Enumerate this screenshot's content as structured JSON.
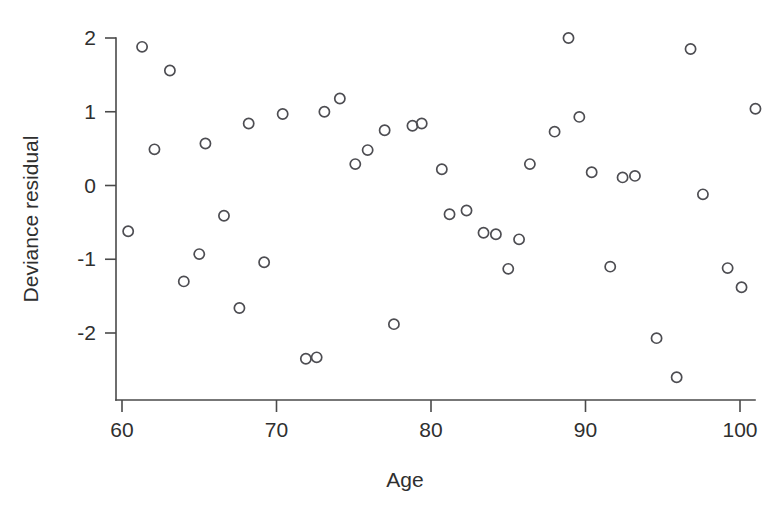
{
  "figure": {
    "width": 769,
    "height": 510,
    "background": "#ffffff",
    "ink_color": "#4a4a4a",
    "marker_color": "#4d4d52",
    "ghost_text": {
      "line1": "",
      "line2": "",
      "line3": ""
    }
  },
  "chart_data": {
    "type": "scatter",
    "title": "",
    "xlabel": "Age",
    "ylabel": "Deviance residual",
    "xlim": [
      58.5,
      104.5
    ],
    "ylim": [
      -2.9,
      2.25
    ],
    "xticks": [
      60,
      70,
      80,
      90,
      100
    ],
    "xticklabels": [
      "60",
      "70",
      "80",
      "90",
      "100"
    ],
    "yticks": [
      2,
      1,
      0,
      -1,
      -2
    ],
    "yticklabels": [
      "2",
      "1",
      "0",
      "-1",
      "-2"
    ],
    "grid": false,
    "legend": null,
    "marker": "open-circle",
    "series": [
      {
        "name": "Deviance residual",
        "x": [
          60.4,
          61.3,
          62.0,
          63.1,
          64.0,
          65.0,
          65.4,
          66.1,
          67.5,
          68.0,
          68.4,
          69.6,
          70.2,
          71.4,
          72.4,
          73.1,
          74.1,
          75.1,
          75.6,
          76.6,
          77.3,
          78.3,
          79.2,
          79.6,
          80.9,
          81.6,
          82.0,
          83.5,
          83.8,
          84.4,
          85.0,
          86.1,
          86.4,
          87.8,
          88.0,
          89.6,
          90.4,
          91.4,
          92.4,
          93.7,
          94.3,
          95.6,
          96.3,
          97.8,
          98.3,
          99.8,
          101.2,
          102.5,
          102.8,
          103.6
        ],
        "y": [
          -0.62,
          1.88,
          0.49,
          1.56,
          -1.3,
          -0.93,
          0.57,
          -0.41,
          -1.66,
          0.84,
          -1.04,
          0.97,
          -2.35,
          -2.33,
          1.0,
          1.18,
          0.29,
          0.48,
          0.75,
          -1.88,
          0.81,
          0.84,
          0.22,
          -0.39,
          -0.34,
          -0.64,
          -0.66,
          -1.13,
          -0.73,
          0.29,
          0.73,
          2.0,
          0.93,
          0.18,
          -1.1,
          0.11,
          0.13,
          -2.07,
          -2.6,
          1.85,
          -0.12,
          -1.12,
          -1.38,
          1.04,
          0.0,
          0.0,
          0.0,
          0.0,
          0.0,
          0.0
        ]
      }
    ],
    "points": [
      {
        "x": 60.4,
        "y": -0.62
      },
      {
        "x": 61.3,
        "y": 1.88
      },
      {
        "x": 62.1,
        "y": 0.49
      },
      {
        "x": 63.1,
        "y": 1.56
      },
      {
        "x": 64.0,
        "y": -1.3
      },
      {
        "x": 65.0,
        "y": -0.93
      },
      {
        "x": 65.4,
        "y": 0.57
      },
      {
        "x": 66.6,
        "y": -0.41
      },
      {
        "x": 67.6,
        "y": -1.66
      },
      {
        "x": 68.2,
        "y": 0.84
      },
      {
        "x": 69.2,
        "y": -1.04
      },
      {
        "x": 70.4,
        "y": 0.97
      },
      {
        "x": 71.9,
        "y": -2.35
      },
      {
        "x": 72.6,
        "y": -2.33
      },
      {
        "x": 73.1,
        "y": 1.0
      },
      {
        "x": 74.1,
        "y": 1.18
      },
      {
        "x": 75.1,
        "y": 0.29
      },
      {
        "x": 75.9,
        "y": 0.48
      },
      {
        "x": 77.0,
        "y": 0.75
      },
      {
        "x": 77.6,
        "y": -1.88
      },
      {
        "x": 78.8,
        "y": 0.81
      },
      {
        "x": 79.4,
        "y": 0.84
      },
      {
        "x": 80.7,
        "y": 0.22
      },
      {
        "x": 81.2,
        "y": -0.39
      },
      {
        "x": 82.3,
        "y": -0.34
      },
      {
        "x": 83.4,
        "y": -0.64
      },
      {
        "x": 84.2,
        "y": -0.66
      },
      {
        "x": 85.0,
        "y": -1.13
      },
      {
        "x": 85.7,
        "y": -0.73
      },
      {
        "x": 86.4,
        "y": 0.29
      },
      {
        "x": 88.0,
        "y": 0.73
      },
      {
        "x": 88.9,
        "y": 2.0
      },
      {
        "x": 89.6,
        "y": 0.93
      },
      {
        "x": 90.4,
        "y": 0.18
      },
      {
        "x": 91.6,
        "y": -1.1
      },
      {
        "x": 92.4,
        "y": 0.11
      },
      {
        "x": 93.2,
        "y": 0.13
      },
      {
        "x": 94.6,
        "y": -2.07
      },
      {
        "x": 95.9,
        "y": -2.6
      },
      {
        "x": 96.8,
        "y": 1.85
      },
      {
        "x": 97.6,
        "y": -0.12
      },
      {
        "x": 99.2,
        "y": -1.12
      },
      {
        "x": 100.1,
        "y": -1.38
      },
      {
        "x": 101.0,
        "y": 1.04
      }
    ]
  }
}
